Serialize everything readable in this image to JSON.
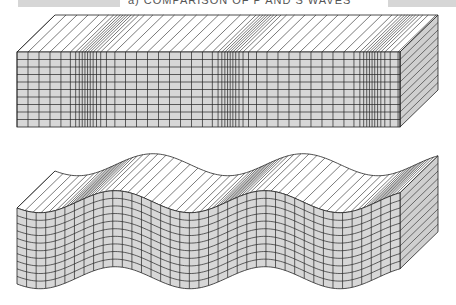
{
  "header": {
    "title": "a) COMPARISON OF P AND S WAVES",
    "left_bar": {
      "x": 18,
      "width": 102
    },
    "right_bar": {
      "x": 388,
      "width": 68
    }
  },
  "diagrams": [
    {
      "name": "p-wave-block",
      "label": "P wave (compressional)",
      "front": {
        "x0": 17,
        "x1": 400,
        "y_top": 52,
        "y_bottom": 127
      },
      "depth": {
        "dx": 38,
        "dy": -37
      },
      "rows": 10,
      "compression_centers": [
        85,
        228,
        370
      ],
      "colors": {
        "front": "#d7d7d7",
        "side": "#cfcfcf",
        "top": "#ffffff",
        "line": "#222222"
      }
    },
    {
      "name": "s-wave-block",
      "label": "S wave (shear)",
      "front": {
        "x0": 17,
        "x1": 400,
        "y_top": 208,
        "y_bottom": 284
      },
      "depth": {
        "dx": 38,
        "dy": -37
      },
      "rows": 10,
      "columns": 40,
      "wave": {
        "amplitude": 11,
        "period": 150,
        "phase_x": 115
      },
      "colors": {
        "front": "#d7d7d7",
        "side": "#cfcfcf",
        "top": "#ffffff",
        "line": "#222222"
      }
    }
  ]
}
